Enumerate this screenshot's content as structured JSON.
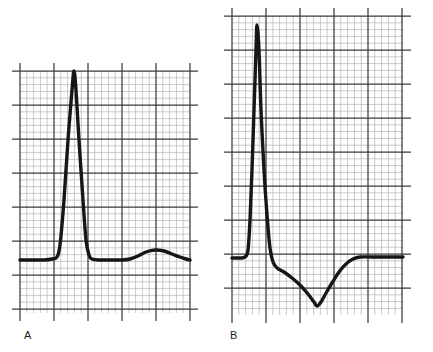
{
  "figure": {
    "title": "",
    "background_color": "#ffffff",
    "width": 433,
    "height": 352,
    "trace_color": "#161616",
    "grid_minor_color": "#9a9a9a",
    "grid_major_color": "#3a3a3a"
  },
  "panels": [
    {
      "id": "A",
      "label": "A",
      "label_x": 24,
      "label_y": 330,
      "grid": {
        "x0": 20,
        "y0": 71,
        "x1": 190,
        "y1": 313,
        "minor_step": 6.8,
        "major_step": 34,
        "overshoot": 8,
        "cols_minor": 25,
        "rows_minor": 35.5
      },
      "baseline_y": 259,
      "description": "Normal ECG QRS complex with upright R wave and upright T wave"
    },
    {
      "id": "B",
      "label": "B",
      "label_x": 230,
      "label_y": 330,
      "grid": {
        "x0": 232,
        "y0": 16,
        "x1": 403,
        "y1": 315,
        "minor_step": 6.8,
        "major_step": 34,
        "overshoot": 8,
        "cols_minor": 25,
        "rows_minor": 44,
        "major_cols": [
          232,
          266,
          300,
          334,
          368,
          402
        ]
      },
      "baseline_y": 258,
      "description": "ECG QRS complex with tall narrow R wave followed by deep inverted T wave"
    }
  ],
  "chart_data": {
    "type": "line",
    "title": "",
    "xlabel": "",
    "ylabel": "",
    "grid": true,
    "legend": "none",
    "series": [
      {
        "name": "A",
        "panel": "A",
        "comment": "ECG tracing A: flat baseline, tall narrow R wave peaking at top gridline, return to baseline, broad low-amplitude upright T wave",
        "points": [
          [
            20,
            260
          ],
          [
            34,
            260
          ],
          [
            44,
            260
          ],
          [
            52,
            259
          ],
          [
            57,
            257
          ],
          [
            60,
            245
          ],
          [
            64,
            200
          ],
          [
            68,
            140
          ],
          [
            72,
            90
          ],
          [
            74,
            71
          ],
          [
            76,
            90
          ],
          [
            79,
            140
          ],
          [
            83,
            200
          ],
          [
            86,
            240
          ],
          [
            89,
            255
          ],
          [
            92,
            259
          ],
          [
            100,
            260
          ],
          [
            112,
            260
          ],
          [
            122,
            260
          ],
          [
            130,
            259
          ],
          [
            138,
            256
          ],
          [
            146,
            252
          ],
          [
            155,
            250
          ],
          [
            164,
            251
          ],
          [
            172,
            254
          ],
          [
            180,
            257
          ],
          [
            186,
            259
          ],
          [
            190,
            260
          ]
        ]
      },
      {
        "name": "B",
        "panel": "B",
        "comment": "ECG tracing B: flat baseline, very tall narrow R wave reaching near top of strip, sharp descent below baseline, gradual deep inverted T wave trough, return to baseline",
        "points": [
          [
            232,
            258
          ],
          [
            240,
            258
          ],
          [
            245,
            257
          ],
          [
            248,
            250
          ],
          [
            250,
            220
          ],
          [
            252,
            170
          ],
          [
            254,
            110
          ],
          [
            256,
            50
          ],
          [
            257,
            25
          ],
          [
            259,
            50
          ],
          [
            261,
            110
          ],
          [
            264,
            170
          ],
          [
            267,
            215
          ],
          [
            270,
            248
          ],
          [
            273,
            262
          ],
          [
            277,
            268
          ],
          [
            284,
            272
          ],
          [
            292,
            278
          ],
          [
            300,
            285
          ],
          [
            308,
            294
          ],
          [
            314,
            302
          ],
          [
            317,
            306
          ],
          [
            321,
            302
          ],
          [
            326,
            293
          ],
          [
            332,
            283
          ],
          [
            339,
            272
          ],
          [
            346,
            264
          ],
          [
            353,
            259
          ],
          [
            360,
            257
          ],
          [
            372,
            257
          ],
          [
            386,
            257
          ],
          [
            403,
            257
          ]
        ]
      }
    ]
  }
}
